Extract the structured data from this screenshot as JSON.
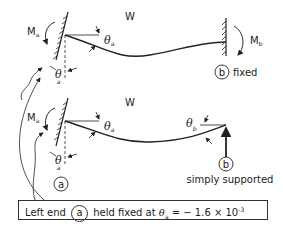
{
  "top_case": {
    "load_label": "W",
    "moment_left": "M",
    "moment_left_sub": "a",
    "moment_right": "M",
    "moment_right_sub": "b",
    "theta": "θ",
    "theta_sub": "a",
    "right_end_id": "b",
    "right_end_condition": "fixed"
  },
  "bottom_case": {
    "load_label": "W",
    "moment_left": "M",
    "moment_left_sub": "a",
    "theta": "θ",
    "theta_a_sub": "a",
    "theta_b_sub": "b",
    "left_end_id": "a",
    "right_end_id": "b",
    "right_end_condition": "simply supported"
  },
  "caption": {
    "prefix": "Left end",
    "end_id": "a",
    "middle": "held fixed at",
    "theta": "θ",
    "theta_sub": "a",
    "equation": "= − 1.6 × 10",
    "exponent": "-3"
  }
}
